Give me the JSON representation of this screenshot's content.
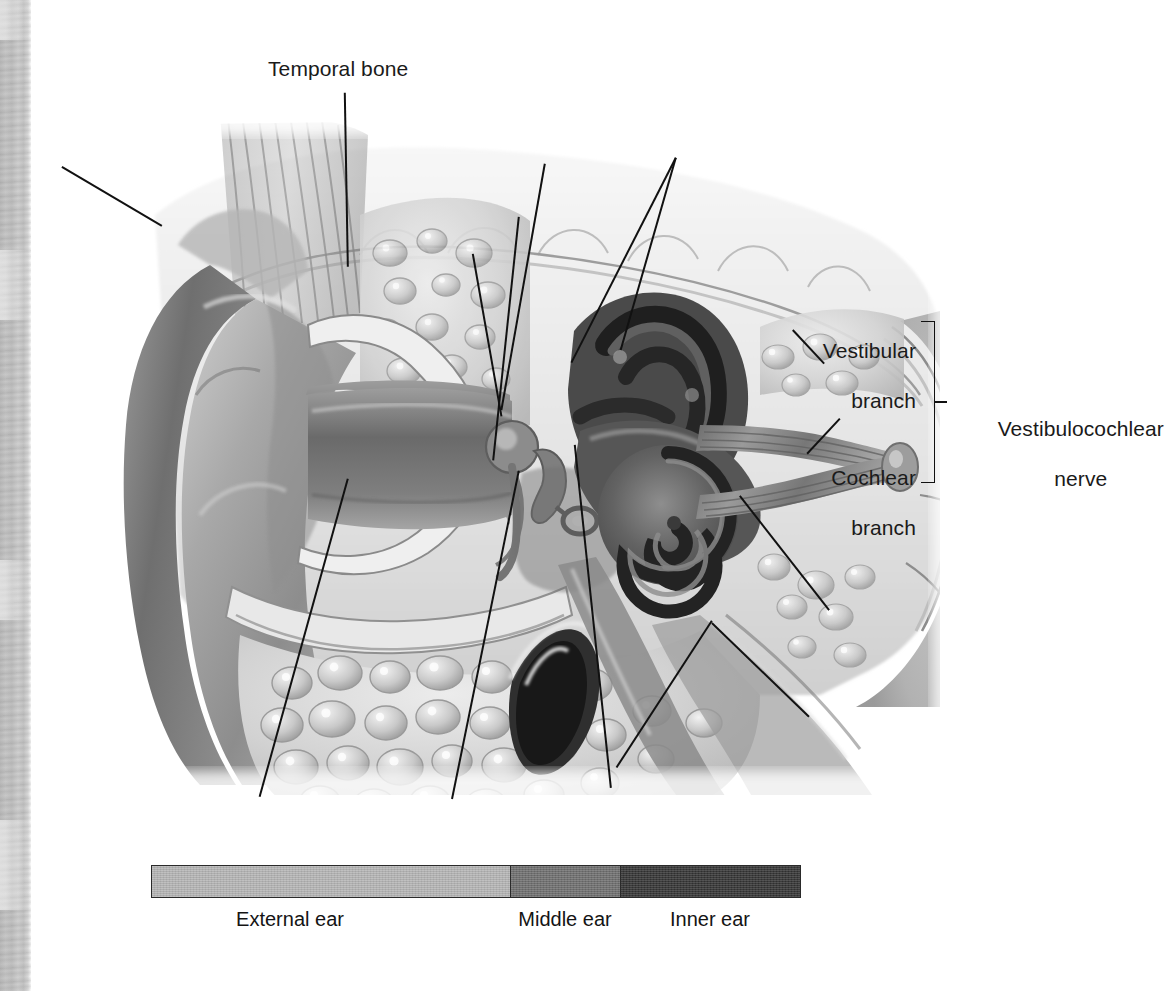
{
  "figure": {
    "kind": "anatomical-illustration",
    "style": "grayscale medical illustration on white background",
    "scan_edge_color": "#c2c2c2"
  },
  "labels": {
    "temporal_bone": "Temporal bone",
    "vestibular_branch_line1": "Vestibular",
    "vestibular_branch_line2": "branch",
    "cochlear_branch_line1": "Cochlear",
    "cochlear_branch_line2": "branch",
    "vestibulocochlear_nerve_line1": "Vestibulocochlear",
    "vestibulocochlear_nerve_line2": "nerve"
  },
  "legend": {
    "title": "",
    "segments": [
      {
        "label": "External ear",
        "color": "#b4b4b4"
      },
      {
        "label": "Middle ear",
        "color": "#6e6e6e"
      },
      {
        "label": "Inner ear",
        "color": "#343434"
      }
    ]
  },
  "line_art_color": "#111111"
}
